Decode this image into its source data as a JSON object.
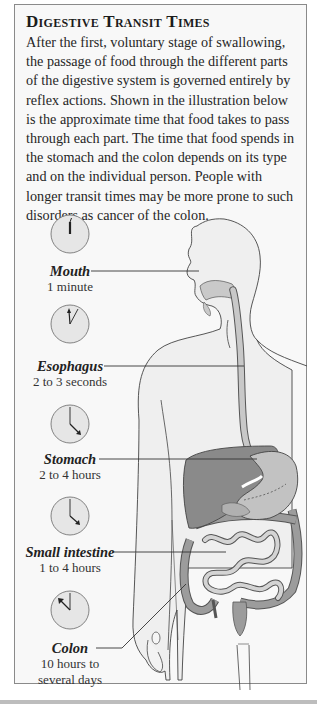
{
  "header": {
    "title": "Digestive Transit Times"
  },
  "intro": {
    "text": "After the first, voluntary stage of swallowing, the passage of food through the different parts of the digestive system is governed entirely by reflex actions. Shown in the illustration below is the approximate time that food takes to pass through each part. The time that food spends in the stomach and the colon depends on its type and on the individual person. People with longer transit times may be more prone to such disorders as cancer of the colon."
  },
  "stages": [
    {
      "name": "Mouth",
      "time": "1 minute",
      "icon": "clock-icon"
    },
    {
      "name": "Esophagus",
      "time": "2 to 3 seconds",
      "icon": "clock-icon"
    },
    {
      "name": "Stomach",
      "time": "2 to 4 hours",
      "icon": "clock-icon"
    },
    {
      "name": "Small intestine",
      "time": "1 to 4 hours",
      "icon": "clock-icon"
    },
    {
      "name": "Colon",
      "time_line1": "10 hours to",
      "time_line2": "several days",
      "icon": "clock-icon"
    }
  ],
  "colors": {
    "panel_bg": "#f8f8f8",
    "border": "#8a8a8a",
    "body_fill": "#ececec",
    "organ_dark": "#8e8e8e",
    "organ_mid": "#b4b4b4",
    "organ_light": "#d6d6d6",
    "clock_fill": "#e6e6e6"
  }
}
